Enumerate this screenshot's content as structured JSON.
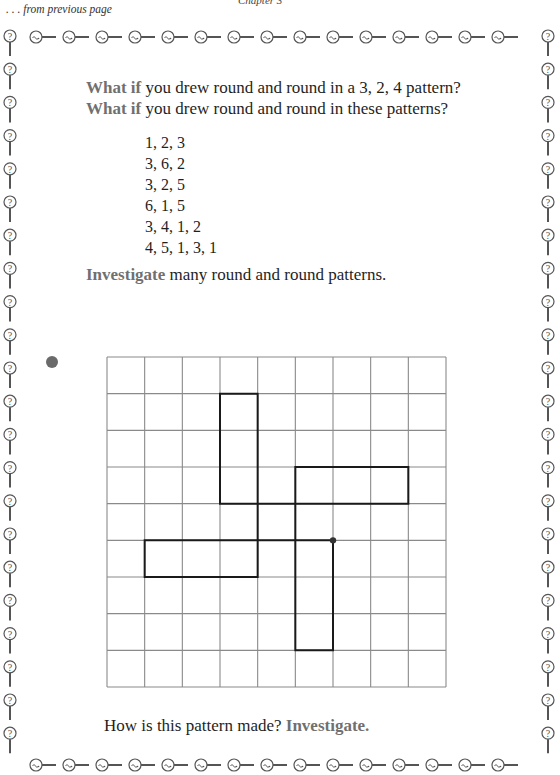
{
  "header": {
    "chapter": "Chapter 3",
    "continued": ". . . from previous page"
  },
  "intro": [
    {
      "keyword": "What if",
      "text": " you drew round and round in a 3, 2, 4 pattern?"
    },
    {
      "keyword": "What if",
      "text": " you drew round and round in these patterns?"
    }
  ],
  "patterns": [
    "1, 2, 3",
    "3, 6, 2",
    "3, 2, 5",
    "6, 1, 5",
    "3, 4, 1, 2",
    "4, 5, 1, 3, 1"
  ],
  "investigate_line": {
    "keyword": "Investigate",
    "text": " many round and round patterns."
  },
  "question": {
    "text": "How is this pattern made? ",
    "keyword": "Investigate."
  },
  "figure": {
    "grid": {
      "cols": 9,
      "rows": 9,
      "x0": 107,
      "y0": 357,
      "x1": 446,
      "y1": 687
    },
    "start_point": [
      6,
      5
    ],
    "path": [
      [
        6,
        5
      ],
      [
        6,
        8
      ],
      [
        5,
        8
      ],
      [
        5,
        3
      ],
      [
        8,
        3
      ],
      [
        8,
        4
      ],
      [
        3,
        4
      ],
      [
        3,
        1
      ],
      [
        4,
        1
      ],
      [
        4,
        6
      ],
      [
        1,
        6
      ],
      [
        1,
        5
      ],
      [
        6,
        5
      ]
    ]
  },
  "colors": {
    "keyword": "#707070",
    "text": "#1f1f1f",
    "grid": "#8a8a8a",
    "path": "#1a1a1a",
    "border": "#555555"
  },
  "border": {
    "icon": "magnifier-question-icon",
    "top_count": 15,
    "side_count": 22
  }
}
